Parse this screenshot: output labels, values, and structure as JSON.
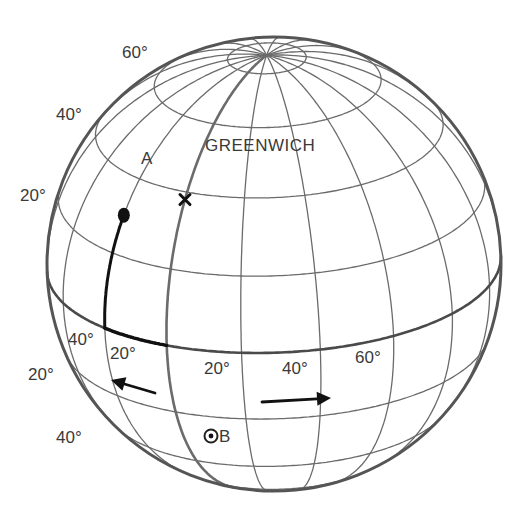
{
  "diagram": {
    "title": "",
    "globe": {
      "center": [
        274,
        264
      ],
      "radius": 227,
      "tilt_deg": 23,
      "central_meridian_deg": 29,
      "screen_rotation_deg": 2,
      "grid_step_deg": 20,
      "line_color": "#6b6b6b",
      "outline_color": "#555555",
      "bold_color": "#111111"
    },
    "latitude_labels_north": [
      {
        "text": "60°",
        "x": 122,
        "y": 44
      },
      {
        "text": "40°",
        "x": 56,
        "y": 106
      },
      {
        "text": "20°",
        "x": 20,
        "y": 187
      }
    ],
    "latitude_labels_south": [
      {
        "text": "20°",
        "x": 28,
        "y": 366
      },
      {
        "text": "40°",
        "x": 56,
        "y": 429
      }
    ],
    "longitude_labels": [
      {
        "text": "40°",
        "x": 68,
        "y": 331
      },
      {
        "text": "20°",
        "x": 110,
        "y": 345
      },
      {
        "text": "20°",
        "x": 204,
        "y": 360
      },
      {
        "text": "40°",
        "x": 282,
        "y": 360
      },
      {
        "text": "60°",
        "x": 355,
        "y": 349
      }
    ],
    "points": {
      "A": {
        "label": "A",
        "lat": 30,
        "lon": -20,
        "label_x": 141,
        "label_y": 150
      },
      "B": {
        "label": "B",
        "lat": -30,
        "lon": 12,
        "label_x": 219,
        "label_y": 428
      },
      "greenwich": {
        "label": "GREENWICH",
        "lat": 38,
        "lon": 0,
        "label_x": 205,
        "label_y": 137
      }
    },
    "bold_path": {
      "description": "Meridian segment from A down to equator then east along equator to Greenwich meridian",
      "from_lat": 30,
      "meridian_lon": -20,
      "to_lon": 0
    },
    "arrows": [
      {
        "name": "westward-arrow",
        "direction": "west",
        "x1": 155,
        "y1": 393,
        "x2": 111,
        "y2": 380
      },
      {
        "name": "eastward-arrow",
        "direction": "east",
        "x1": 262,
        "y1": 402,
        "x2": 331,
        "y2": 398
      }
    ]
  }
}
